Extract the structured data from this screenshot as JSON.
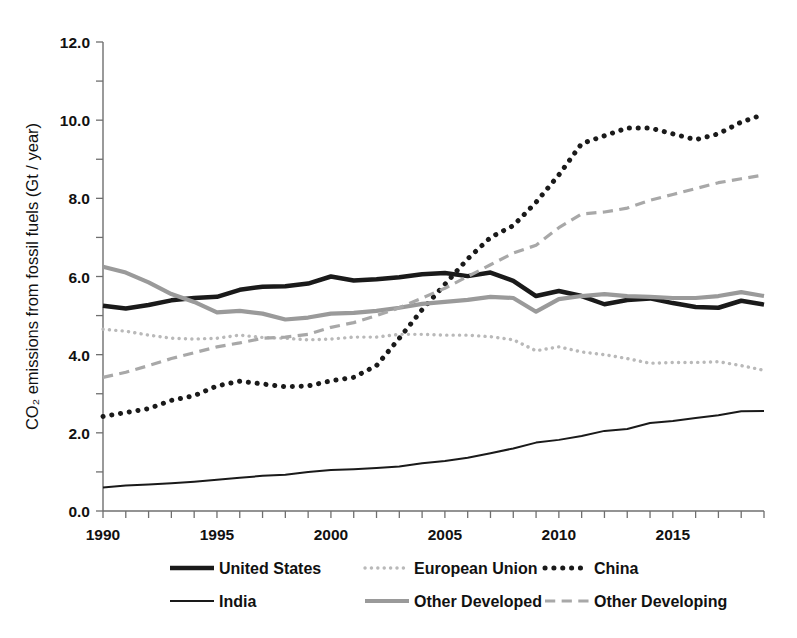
{
  "chart_data": {
    "type": "line",
    "title": "",
    "xlabel": "",
    "ylabel": "CO₂ emissions from fossil fuels (Gt / year)",
    "xlim": [
      1990,
      2019
    ],
    "ylim": [
      0.0,
      12.0
    ],
    "grid": false,
    "legend_position": "bottom",
    "x": [
      1990,
      1991,
      1992,
      1993,
      1994,
      1995,
      1996,
      1997,
      1998,
      1999,
      2000,
      2001,
      2002,
      2003,
      2004,
      2005,
      2006,
      2007,
      2008,
      2009,
      2010,
      2011,
      2012,
      2013,
      2014,
      2015,
      2016,
      2017,
      2018,
      2019
    ],
    "xticks": [
      1990,
      1995,
      2000,
      2005,
      2010,
      2015
    ],
    "xticklabels": [
      "1990",
      "1995",
      "2000",
      "2005",
      "2010",
      "2015"
    ],
    "yticks": [
      0.0,
      2.0,
      4.0,
      6.0,
      8.0,
      10.0,
      12.0
    ],
    "yticklabels": [
      "0.0",
      "2.0",
      "4.0",
      "6.0",
      "8.0",
      "10.0",
      "12.0"
    ],
    "y_minor_tick_step": 1.0,
    "series": [
      {
        "name": "United States",
        "style": "solid-thick",
        "color": "#1a1a1a",
        "width": 4.5,
        "values": [
          5.25,
          5.18,
          5.27,
          5.39,
          5.45,
          5.48,
          5.66,
          5.74,
          5.75,
          5.82,
          6.0,
          5.9,
          5.93,
          5.98,
          6.06,
          6.09,
          6.01,
          6.1,
          5.89,
          5.5,
          5.63,
          5.5,
          5.29,
          5.4,
          5.44,
          5.32,
          5.22,
          5.2,
          5.38,
          5.28
        ]
      },
      {
        "name": "European Union",
        "style": "dotted-fine",
        "color": "#b9b9b9",
        "width": 3.4,
        "values": [
          4.65,
          4.6,
          4.5,
          4.42,
          4.4,
          4.42,
          4.5,
          4.44,
          4.42,
          4.38,
          4.4,
          4.45,
          4.45,
          4.52,
          4.52,
          4.5,
          4.5,
          4.46,
          4.38,
          4.1,
          4.2,
          4.07,
          4.0,
          3.9,
          3.78,
          3.8,
          3.8,
          3.82,
          3.72,
          3.6
        ]
      },
      {
        "name": "China",
        "style": "dotted-bold",
        "color": "#1a1a1a",
        "width": 5.0,
        "values": [
          2.42,
          2.52,
          2.62,
          2.83,
          2.95,
          3.2,
          3.32,
          3.25,
          3.18,
          3.2,
          3.33,
          3.42,
          3.72,
          4.42,
          5.15,
          5.8,
          6.45,
          7.0,
          7.3,
          7.9,
          8.6,
          9.4,
          9.6,
          9.8,
          9.8,
          9.65,
          9.5,
          9.65,
          9.95,
          10.15
        ]
      },
      {
        "name": "India",
        "style": "solid-thin",
        "color": "#1a1a1a",
        "width": 2.0,
        "values": [
          0.6,
          0.65,
          0.68,
          0.71,
          0.75,
          0.8,
          0.85,
          0.9,
          0.93,
          1.0,
          1.05,
          1.07,
          1.1,
          1.14,
          1.22,
          1.28,
          1.36,
          1.48,
          1.6,
          1.75,
          1.82,
          1.92,
          2.05,
          2.1,
          2.25,
          2.3,
          2.38,
          2.45,
          2.55,
          2.56
        ]
      },
      {
        "name": "Other Developed",
        "style": "solid-gray",
        "color": "#9a9a9a",
        "width": 4.2,
        "values": [
          6.25,
          6.1,
          5.85,
          5.55,
          5.35,
          5.08,
          5.12,
          5.05,
          4.9,
          4.95,
          5.05,
          5.07,
          5.12,
          5.2,
          5.3,
          5.35,
          5.4,
          5.48,
          5.45,
          5.1,
          5.42,
          5.5,
          5.55,
          5.5,
          5.48,
          5.45,
          5.45,
          5.5,
          5.6,
          5.5
        ]
      },
      {
        "name": "Other Developing",
        "style": "dashed",
        "color": "#a8a8a8",
        "width": 3.2,
        "values": [
          3.42,
          3.55,
          3.72,
          3.9,
          4.05,
          4.2,
          4.3,
          4.42,
          4.45,
          4.52,
          4.7,
          4.82,
          5.0,
          5.2,
          5.45,
          5.7,
          6.0,
          6.3,
          6.6,
          6.8,
          7.25,
          7.6,
          7.65,
          7.75,
          7.95,
          8.1,
          8.25,
          8.4,
          8.5,
          8.6
        ]
      }
    ]
  },
  "legend": {
    "rows": [
      [
        {
          "label": "United States",
          "style": "solid-thick"
        },
        {
          "label": "European Union",
          "style": "dotted-fine"
        },
        {
          "label": "China",
          "style": "dotted-bold"
        }
      ],
      [
        {
          "label": "India",
          "style": "solid-thin"
        },
        {
          "label": "Other Developed",
          "style": "solid-gray"
        },
        {
          "label": "Other Developing",
          "style": "dashed"
        }
      ]
    ]
  }
}
